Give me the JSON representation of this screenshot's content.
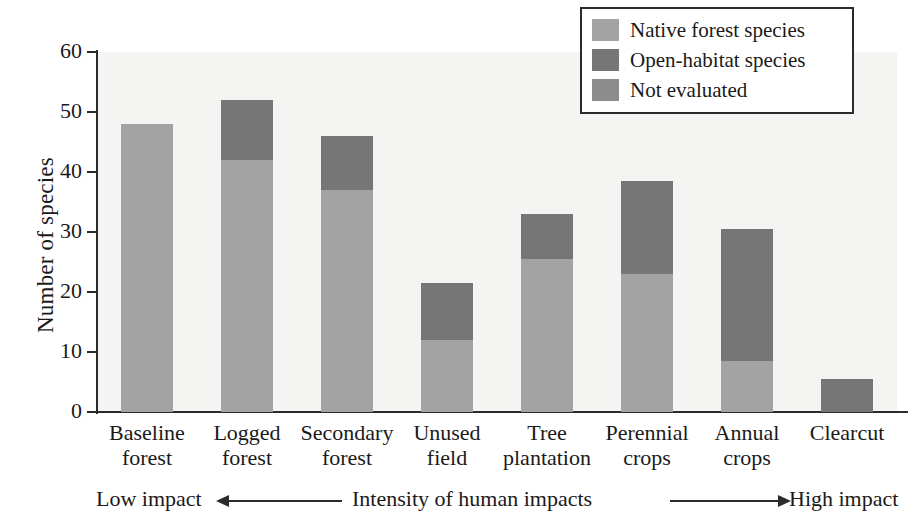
{
  "chart_data": {
    "type": "bar",
    "stacked": true,
    "title": "",
    "xlabel": "Intensity of human impacts",
    "ylabel": "Number of species",
    "ylim": [
      0,
      60
    ],
    "yticks": [
      0,
      10,
      20,
      30,
      40,
      50,
      60
    ],
    "ytick_labels": [
      "0",
      "10",
      "20",
      "30",
      "40",
      "50",
      "60"
    ],
    "grid": false,
    "legend_position": "top-right",
    "categories": [
      "Baseline forest",
      "Logged forest",
      "Secondary forest",
      "Unused field",
      "Tree plantation",
      "Perennial crops",
      "Annual crops",
      "Clearcut"
    ],
    "category_lines": [
      [
        "Baseline",
        "forest"
      ],
      [
        "Logged",
        "forest"
      ],
      [
        "Secondary",
        "forest"
      ],
      [
        "Unused",
        "field"
      ],
      [
        "Tree",
        "plantation"
      ],
      [
        "Perennial",
        "crops"
      ],
      [
        "Annual",
        "crops"
      ],
      [
        "Clearcut",
        ""
      ]
    ],
    "series": [
      {
        "name": "Native forest species",
        "color": "#a3a3a3",
        "values": [
          48,
          42,
          37,
          12,
          25.5,
          23,
          8.5,
          0
        ]
      },
      {
        "name": "Open-habitat species",
        "color": "#767676",
        "values": [
          0,
          10,
          9,
          9.5,
          7.5,
          15.5,
          22,
          5.5
        ]
      }
    ],
    "totals": [
      48,
      52,
      46,
      21.5,
      33,
      38.5,
      30.5,
      5.5
    ],
    "annotations": {
      "left": "Low impact",
      "center": "Intensity of human impacts",
      "right": "High impact"
    }
  },
  "legend": {
    "items": [
      {
        "label": "Native forest species",
        "color": "#a3a3a3"
      },
      {
        "label": "Open-habitat species",
        "color": "#767676"
      },
      {
        "label": "Not evaluated",
        "color": "#8c8c8c"
      }
    ]
  },
  "colors": {
    "native": "#a3a3a3",
    "open_habitat": "#767676",
    "not_evaluated": "#8c8c8c",
    "axis": "#2b2b2b",
    "plot_background": "#f4f4f2",
    "page_background": "#ffffff"
  }
}
